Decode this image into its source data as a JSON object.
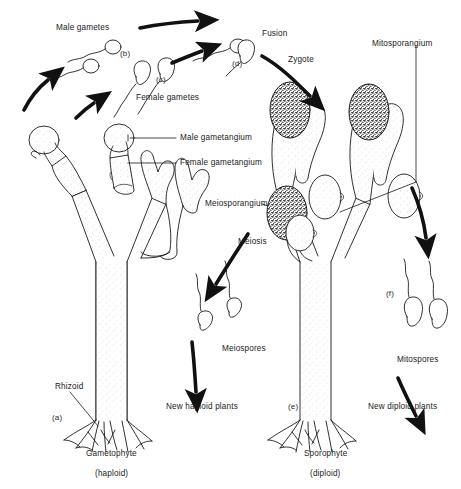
{
  "figure": {
    "background_color": "#ffffff",
    "ink_color": "#1a1a1a"
  },
  "labels": {
    "male_gametes": "Male gametes",
    "female_gametes": "Female gametes",
    "fusion": "Fusion",
    "zygote": "Zygote",
    "mitosporangium": "Mitosporangium",
    "meiosporangium": "Meiosporangium",
    "meiosis": "Meiosis",
    "meiospores": "Meiospores",
    "mitospores": "Mitospores",
    "male_gametangium": "Male gametangium",
    "female_gametangium": "Female gametangium",
    "rhizoid": "Rhizoid",
    "new_haploid_plants": "New haploid plants",
    "new_diploid_plants": "New diploid plants",
    "gametophyte": "Gametophyte",
    "gametophyte_ploidy": "(haploid)",
    "sporophyte": "Sporophyte",
    "sporophyte_ploidy": "(diploid)"
  },
  "stage_markers": {
    "a": "(a)",
    "b": "(b)",
    "c": "(c)",
    "d": "(d)",
    "e": "(e)",
    "f": "(f)"
  }
}
